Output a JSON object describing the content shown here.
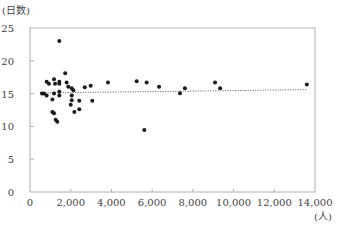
{
  "chart_data": {
    "type": "scatter",
    "title": "",
    "xlabel": "(人)",
    "ylabel": "(日数)",
    "xlim": [
      0,
      14000
    ],
    "ylim": [
      0,
      25
    ],
    "x_ticks": [
      0,
      2000,
      4000,
      6000,
      8000,
      10000,
      12000,
      14000
    ],
    "x_tick_labels": [
      "0",
      "2,000",
      "4,000",
      "6,000",
      "8,000",
      "10,000",
      "12,000",
      "14,000"
    ],
    "y_ticks": [
      0,
      5,
      10,
      15,
      20,
      25
    ],
    "y_tick_labels": [
      "0",
      "5",
      "10",
      "15",
      "20",
      "25"
    ],
    "grid": false,
    "legend": null,
    "trendline": {
      "style": "dotted",
      "x": [
        500,
        13600
      ],
      "y": [
        15.1,
        15.6
      ]
    },
    "series": [
      {
        "name": "points",
        "points": [
          [
            590,
            15.0
          ],
          [
            690,
            15.0
          ],
          [
            820,
            16.8
          ],
          [
            820,
            14.7
          ],
          [
            930,
            16.5
          ],
          [
            1100,
            14.1
          ],
          [
            1100,
            12.2
          ],
          [
            1180,
            17.2
          ],
          [
            1180,
            15.0
          ],
          [
            1180,
            12.0
          ],
          [
            1230,
            16.5
          ],
          [
            1260,
            11.0
          ],
          [
            1340,
            10.7
          ],
          [
            1440,
            23.0
          ],
          [
            1440,
            16.8
          ],
          [
            1440,
            16.5
          ],
          [
            1440,
            15.3
          ],
          [
            1440,
            14.7
          ],
          [
            1730,
            18.1
          ],
          [
            1800,
            16.7
          ],
          [
            1880,
            16.05
          ],
          [
            2050,
            15.8
          ],
          [
            2050,
            14.7
          ],
          [
            2050,
            14.0
          ],
          [
            2130,
            15.5
          ],
          [
            2000,
            13.3
          ],
          [
            2180,
            12.2
          ],
          [
            2420,
            13.9
          ],
          [
            2420,
            12.6
          ],
          [
            2690,
            15.96
          ],
          [
            2980,
            16.2
          ],
          [
            3060,
            13.9
          ],
          [
            3830,
            16.7
          ],
          [
            5240,
            16.9
          ],
          [
            5615,
            9.45
          ],
          [
            5730,
            16.7
          ],
          [
            6340,
            16.05
          ],
          [
            7370,
            15.05
          ],
          [
            7610,
            15.8
          ],
          [
            9090,
            16.7
          ],
          [
            9340,
            15.8
          ],
          [
            13600,
            16.4
          ]
        ]
      }
    ]
  }
}
